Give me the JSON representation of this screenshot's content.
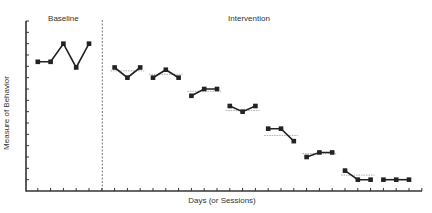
{
  "chart_data": {
    "type": "line",
    "title": "",
    "xlabel": "Days (or Sessions)",
    "ylabel": "Measure of Behavior",
    "ylim": [
      0,
      15
    ],
    "yticks_count": 15,
    "xlim": [
      0,
      30
    ],
    "grid": false,
    "legend": "none",
    "phase_change_x": 6,
    "phases": [
      {
        "label": "Baseline",
        "label_x": 3
      },
      {
        "label": "Intervention",
        "label_x": 17.5
      }
    ],
    "series": [
      {
        "name": "Baseline",
        "x": [
          1,
          2,
          3,
          4,
          5
        ],
        "values": [
          11.4,
          11.4,
          13,
          10.9,
          13
        ],
        "mean": null
      },
      {
        "name": "Intervention segment 1",
        "x": [
          7,
          8,
          9
        ],
        "values": [
          10.9,
          10,
          10.9
        ],
        "mean": 10.6
      },
      {
        "name": "Intervention segment 2",
        "x": [
          10,
          11,
          12
        ],
        "values": [
          10,
          10.7,
          10
        ],
        "mean": 10.3
      },
      {
        "name": "Intervention segment 3",
        "x": [
          13,
          14,
          15
        ],
        "values": [
          8.4,
          9,
          9
        ],
        "mean": 8.8
      },
      {
        "name": "Intervention segment 4",
        "x": [
          16,
          17,
          18
        ],
        "values": [
          7.5,
          7,
          7.5
        ],
        "mean": 7.1
      },
      {
        "name": "Intervention segment 5",
        "x": [
          19,
          20,
          21
        ],
        "values": [
          5.5,
          5.5,
          4.4
        ],
        "mean": 4.9
      },
      {
        "name": "Intervention segment 6",
        "x": [
          22,
          23,
          24
        ],
        "values": [
          3,
          3.4,
          3.4
        ],
        "mean": 3.3
      },
      {
        "name": "Intervention segment 7",
        "x": [
          25,
          26,
          27
        ],
        "values": [
          1.8,
          1,
          1
        ],
        "mean": 1.4
      },
      {
        "name": "Intervention segment 8",
        "x": [
          28,
          29,
          30
        ],
        "values": [
          1,
          1,
          1
        ],
        "mean": null
      }
    ]
  },
  "colors": {
    "line": "#222222",
    "marker": "#222222",
    "mean_line": "#999999",
    "axis": "#333333",
    "phase_line": "#555555"
  }
}
